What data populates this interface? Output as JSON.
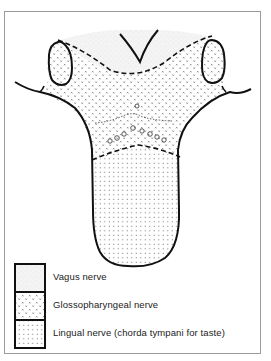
{
  "figure": {
    "regions": [
      {
        "id": "vagus",
        "name": "Vagus nerve",
        "pattern": "fine-stipple",
        "location": "root of tongue near epiglottis"
      },
      {
        "id": "glossopharyngeal",
        "name": "Glossopharyngeal nerve",
        "pattern": "cross-stipple",
        "location": "posterior third of tongue"
      },
      {
        "id": "lingual",
        "name": "Lingual nerve (chorda tympani for taste)",
        "pattern": "dot-grid",
        "location": "anterior two-thirds of tongue"
      }
    ]
  },
  "legend": {
    "items": [
      {
        "label": "Vagus nerve",
        "pattern": "fine-stipple"
      },
      {
        "label": "Glossopharyngeal nerve",
        "pattern": "cross-stipple"
      },
      {
        "label": "Lingual nerve (chorda tympani for taste)",
        "pattern": "dot-grid"
      }
    ]
  },
  "colors": {
    "outline": "#111111",
    "frame": "#9a9a9a",
    "background": "#ffffff",
    "stipple": "#555555"
  }
}
